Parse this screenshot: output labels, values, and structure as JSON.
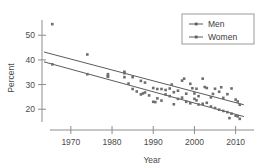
{
  "chart_data": {
    "type": "scatter",
    "title": "",
    "xlabel": "Year",
    "ylabel": "Percent",
    "xlim": [
      1963,
      2013
    ],
    "ylim": [
      14,
      57
    ],
    "xticks": [
      1970,
      1980,
      1990,
      2000,
      2010
    ],
    "yticks": [
      20,
      30,
      40,
      50
    ],
    "grid": false,
    "legend_position": "top-right",
    "legend": [
      "Men",
      "Women"
    ],
    "series": [
      {
        "name": "Men",
        "marker": "square-dot",
        "points": [
          [
            1965.5,
            54.5
          ],
          [
            1974.0,
            42.2
          ],
          [
            1979.0,
            34.2
          ],
          [
            1979.0,
            33.4
          ],
          [
            1983.0,
            35.2
          ],
          [
            1983.0,
            34.6
          ],
          [
            1985.0,
            33.0
          ],
          [
            1987.0,
            31.5
          ],
          [
            1988.0,
            30.8
          ],
          [
            1990.0,
            28.6
          ],
          [
            1991.0,
            28.2
          ],
          [
            1992.0,
            28.2
          ],
          [
            1993.0,
            27.8
          ],
          [
            1994.0,
            28.4
          ],
          [
            1994.5,
            30.0
          ],
          [
            1995.0,
            26.9
          ],
          [
            1996.0,
            27.5
          ],
          [
            1997.0,
            31.6
          ],
          [
            1997.5,
            32.4
          ],
          [
            1998.0,
            26.3
          ],
          [
            1999.0,
            30.3
          ],
          [
            1999.5,
            28.5
          ],
          [
            2000.0,
            26.4
          ],
          [
            2000.5,
            28.3
          ],
          [
            2001.0,
            25.3
          ],
          [
            2002.0,
            32.4
          ],
          [
            2002.5,
            29.0
          ],
          [
            2003.0,
            28.6
          ],
          [
            2004.0,
            24.8
          ],
          [
            2004.5,
            26.2
          ],
          [
            2005.0,
            28.3
          ],
          [
            2006.0,
            27.1
          ],
          [
            2006.5,
            28.9
          ],
          [
            2007.0,
            24.6
          ],
          [
            2008.0,
            26.1
          ],
          [
            2009.0,
            28.4
          ],
          [
            2010.0,
            23.9
          ],
          [
            2010.5,
            23.1
          ],
          [
            2011.0,
            21.8
          ]
        ],
        "trend": {
          "x1": 1963.5,
          "y1": 43.2,
          "x2": 2012.0,
          "y2": 21.8
        }
      },
      {
        "name": "Women",
        "marker": "square-dot",
        "points": [
          [
            1965.5,
            38.2
          ],
          [
            1974.0,
            34.2
          ],
          [
            1979.0,
            33.2
          ],
          [
            1983.0,
            33.0
          ],
          [
            1984.0,
            30.4
          ],
          [
            1985.0,
            28.2
          ],
          [
            1986.0,
            27.2
          ],
          [
            1987.0,
            26.0
          ],
          [
            1987.5,
            26.4
          ],
          [
            1988.0,
            26.8
          ],
          [
            1989.0,
            25.6
          ],
          [
            1990.0,
            23.0
          ],
          [
            1990.5,
            22.9
          ],
          [
            1991.0,
            24.4
          ],
          [
            1992.0,
            23.5
          ],
          [
            1993.0,
            26.0
          ],
          [
            1994.0,
            25.3
          ],
          [
            1995.0,
            22.0
          ],
          [
            1996.0,
            24.2
          ],
          [
            1997.0,
            24.7
          ],
          [
            1998.0,
            23.0
          ],
          [
            1999.0,
            22.4
          ],
          [
            2000.0,
            24.2
          ],
          [
            2000.5,
            23.6
          ],
          [
            2001.0,
            21.9
          ],
          [
            2002.0,
            22.2
          ],
          [
            2003.0,
            22.6
          ],
          [
            2004.0,
            21.1
          ],
          [
            2005.0,
            20.5
          ],
          [
            2006.0,
            19.8
          ],
          [
            2007.0,
            19.3
          ],
          [
            2008.0,
            18.8
          ],
          [
            2008.5,
            16.4
          ],
          [
            2009.0,
            18.2
          ],
          [
            2010.0,
            17.4
          ],
          [
            2010.5,
            17.1
          ],
          [
            2011.0,
            16.1
          ]
        ],
        "trend": {
          "x1": 1963.5,
          "y1": 39.2,
          "x2": 2012.0,
          "y2": 17.0
        }
      }
    ]
  }
}
